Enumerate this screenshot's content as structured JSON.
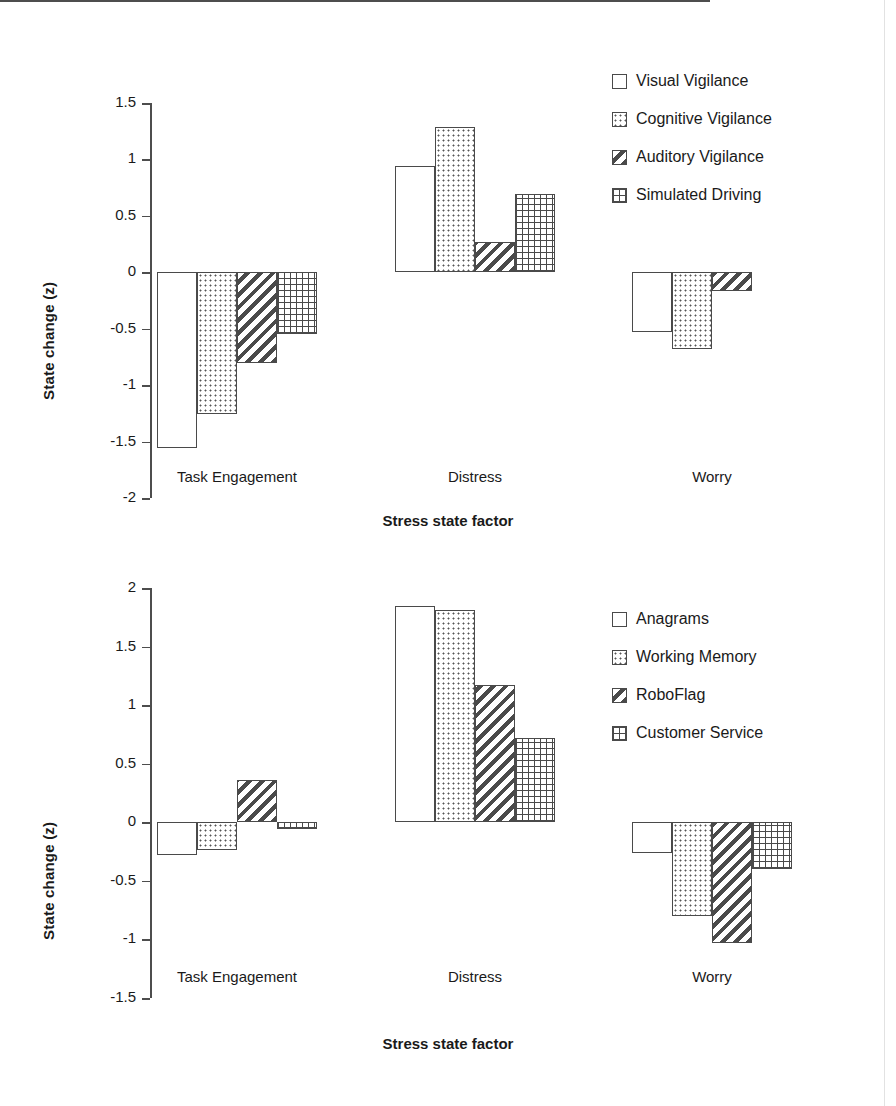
{
  "figure": {
    "background": "#ffffff",
    "axis_color": "#4d4d4d",
    "bar_outline": "#4a4a4a"
  },
  "chart_data": [
    {
      "type": "bar",
      "panel": "top",
      "title": "",
      "xlabel": "Stress state factor",
      "ylabel": "State change (z)",
      "categories": [
        "Task Engagement",
        "Distress",
        "Worry"
      ],
      "ylim": [
        -2,
        1.5
      ],
      "yticks": [
        1.5,
        1,
        0.5,
        0,
        -0.5,
        -1,
        -1.5,
        -2
      ],
      "ytick_labels": [
        "1.5",
        "1",
        "0.5",
        "0",
        "-0.5",
        "-1",
        "-1.5",
        "-2"
      ],
      "grid": false,
      "legend_position": "top-right",
      "series": [
        {
          "name": "Visual Vigilance",
          "pattern": "none",
          "values": [
            -1.56,
            0.94,
            -0.53
          ]
        },
        {
          "name": "Cognitive Vigilance",
          "pattern": "dots",
          "values": [
            -1.26,
            1.29,
            -0.68
          ]
        },
        {
          "name": "Auditory Vigilance",
          "pattern": "diag",
          "values": [
            -0.8,
            0.27,
            -0.17
          ]
        },
        {
          "name": "Simulated Driving",
          "pattern": "grid",
          "values": [
            -0.55,
            0.69,
            0.0
          ]
        }
      ]
    },
    {
      "type": "bar",
      "panel": "bottom",
      "title": "",
      "xlabel": "Stress state factor",
      "ylabel": "State change (z)",
      "categories": [
        "Task Engagement",
        "Distress",
        "Worry"
      ],
      "ylim": [
        -1.5,
        2
      ],
      "yticks": [
        2,
        1.5,
        1,
        0.5,
        0,
        -0.5,
        -1,
        -1.5
      ],
      "ytick_labels": [
        "2",
        "1.5",
        "1",
        "0.5",
        "0",
        "-0.5",
        "-1",
        "-1.5"
      ],
      "grid": false,
      "legend_position": "top-right",
      "series": [
        {
          "name": "Anagrams",
          "pattern": "none",
          "values": [
            -0.28,
            1.85,
            -0.26
          ]
        },
        {
          "name": "Working Memory",
          "pattern": "dots",
          "values": [
            -0.24,
            1.81,
            -0.8
          ]
        },
        {
          "name": "RoboFlag",
          "pattern": "diag",
          "values": [
            0.36,
            1.17,
            -1.03
          ]
        },
        {
          "name": "Customer Service",
          "pattern": "grid",
          "values": [
            -0.06,
            0.72,
            -0.4
          ]
        }
      ]
    }
  ]
}
